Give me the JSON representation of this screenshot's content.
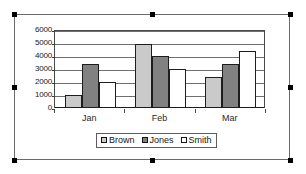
{
  "chart_data": {
    "type": "bar",
    "title": "",
    "subtitle": "",
    "xlabel": "",
    "ylabel": "",
    "categories": [
      "Jan",
      "Feb",
      "Mar"
    ],
    "series": [
      {
        "name": "Brown",
        "values": [
          1000,
          4900,
          2400
        ],
        "color": "#cacaca"
      },
      {
        "name": "Jones",
        "values": [
          3400,
          4000,
          3400
        ],
        "color": "#818181"
      },
      {
        "name": "Smith",
        "values": [
          2000,
          3000,
          4400
        ],
        "color": "#ffffff"
      }
    ],
    "ylim": [
      0,
      6000
    ],
    "yticks": [
      0,
      1000,
      2000,
      3000,
      4000,
      5000,
      6000
    ],
    "ytick_labels": [
      "0",
      "1000",
      "2000",
      "3000",
      "4000",
      "5000",
      "6000"
    ],
    "grid": true,
    "legend_position": "bottom",
    "legend_entries": [
      "Brown",
      "Jones",
      "Smith"
    ]
  },
  "selection": {
    "state_label": "selected",
    "handle_count": 8
  }
}
